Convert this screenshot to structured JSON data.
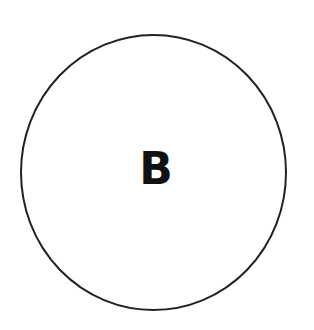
{
  "diagram": {
    "nodes": [
      {
        "id": "B",
        "label": "B",
        "shape": "ellipse",
        "cx": 153.5,
        "cy": 172.5,
        "rx": 132.5,
        "ry": 137.5,
        "stroke": "#222222",
        "fill": "#ffffff"
      }
    ]
  }
}
